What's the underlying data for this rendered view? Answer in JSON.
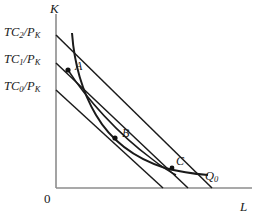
{
  "figure": {
    "type": "economics-isoquant-isocost-diagram",
    "background_color": "#ffffff",
    "line_color": "#1a1a1a",
    "axis_color": "#8c8c8c",
    "width": 259,
    "height": 222
  },
  "axes": {
    "vertical_label": "K",
    "horizontal_label": "L",
    "origin_label": "0",
    "vertical": {
      "x": 56,
      "y_top": 14,
      "y_bottom": 188
    },
    "horizontal": {
      "y": 188,
      "x_left": 56,
      "x_right": 252
    }
  },
  "isocost_lines": [
    {
      "id": "tc0",
      "label_text": "TC",
      "label_sub": "0",
      "label_denom": "/P",
      "label_denom_sub": "K",
      "label_x": 4,
      "label_y": 80,
      "k_intercept_y": 90,
      "l_intercept_x": 163
    },
    {
      "id": "tc1",
      "label_text": "TC",
      "label_sub": "1",
      "label_denom": "/P",
      "label_denom_sub": "K",
      "label_x": 4,
      "label_y": 53,
      "k_intercept_y": 63,
      "l_intercept_x": 188
    },
    {
      "id": "tc2",
      "label_text": "TC",
      "label_sub": "2",
      "label_denom": "/P",
      "label_denom_sub": "K",
      "label_x": 4,
      "label_y": 26,
      "k_intercept_y": 35,
      "l_intercept_x": 212
    }
  ],
  "isoquant": {
    "id": "q0",
    "label_text": "Q",
    "label_sub": "0",
    "label_x": 205,
    "label_y": 170,
    "path": "M 72,33 C 74,60 80,88 96,115 C 110,139 134,158 165,168 C 180,172 195,174 208,175"
  },
  "expansion_path": {
    "id": "expansion-path",
    "path": "M 68,70 C 86,98 118,134 152,159 C 162,167 170,172 176,175"
  },
  "points": [
    {
      "id": "a",
      "label": "A",
      "x": 68,
      "y": 70,
      "label_x": 75,
      "label_y": 60
    },
    {
      "id": "b",
      "label": "B",
      "x": 115,
      "y": 138,
      "label_x": 122,
      "label_y": 127
    },
    {
      "id": "c",
      "label": "C",
      "x": 172,
      "y": 168,
      "label_x": 176,
      "label_y": 155
    }
  ]
}
